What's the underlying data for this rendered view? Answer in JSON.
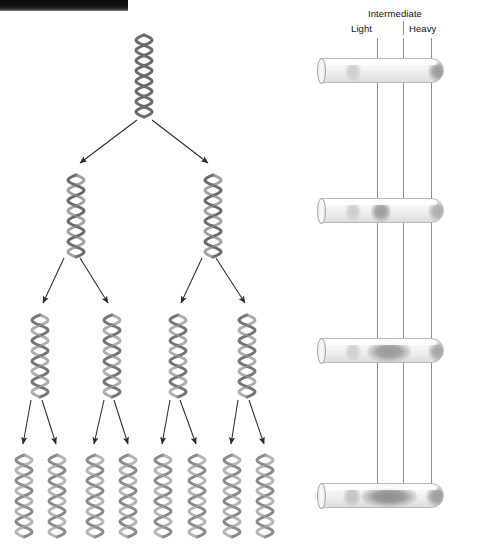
{
  "figure": {
    "artifact_bar": "black-scan-edge"
  },
  "gradient_panel": {
    "labels": {
      "intermediate": "Intermediate",
      "light": "Light",
      "heavy": "Heavy"
    },
    "guide_lines": [
      {
        "name": "light-guide",
        "x": 377
      },
      {
        "name": "intermediate-guide",
        "x": 403
      },
      {
        "name": "heavy-guide",
        "x": 431
      }
    ],
    "tubes": [
      {
        "name": "tube-generation-0",
        "x": 312,
        "y": 58,
        "bands": [
          {
            "position": "light",
            "x": 24,
            "width": 16,
            "intensity": "faint",
            "color": "#cdcdcd"
          },
          {
            "position": "heavy",
            "x": 107,
            "width": 22,
            "intensity": "strong",
            "color": "#9a9a9a"
          }
        ]
      },
      {
        "name": "tube-generation-1",
        "x": 312,
        "y": 198,
        "bands": [
          {
            "position": "light",
            "x": 24,
            "width": 16,
            "intensity": "faint",
            "color": "#cdcdcd"
          },
          {
            "position": "intermediate",
            "x": 50,
            "width": 20,
            "intensity": "strong",
            "color": "#9c9c9c"
          },
          {
            "position": "heavy",
            "x": 107,
            "width": 22,
            "intensity": "medium",
            "color": "#ababab"
          }
        ]
      },
      {
        "name": "tube-generation-2",
        "x": 312,
        "y": 338,
        "bands": [
          {
            "position": "light",
            "x": 24,
            "width": 16,
            "intensity": "faint",
            "color": "#d0d0d0"
          },
          {
            "position": "intermediate",
            "x": 46,
            "width": 44,
            "intensity": "strong",
            "color": "#989898"
          },
          {
            "position": "heavy",
            "x": 107,
            "width": 22,
            "intensity": "medium",
            "color": "#a5a5a5"
          }
        ]
      },
      {
        "name": "tube-generation-3",
        "x": 312,
        "y": 483,
        "bands": [
          {
            "position": "light",
            "x": 22,
            "width": 18,
            "intensity": "medium",
            "color": "#c2c2c2"
          },
          {
            "position": "intermediate",
            "x": 40,
            "width": 56,
            "intensity": "strong",
            "color": "#8f8f8f"
          },
          {
            "position": "heavy",
            "x": 105,
            "width": 24,
            "intensity": "strong",
            "color": "#9c9c9c"
          }
        ]
      }
    ]
  },
  "replication_tree": {
    "generations": [
      {
        "name": "generation-0",
        "count": 1,
        "y": 32,
        "helices": [
          {
            "name": "dna-helix-g0-1",
            "x": 131,
            "strand_a": "#6b6b6b",
            "strand_b": "#6b6b6b"
          }
        ]
      },
      {
        "name": "generation-1",
        "count": 2,
        "y": 172,
        "helices": [
          {
            "name": "dna-helix-g1-1",
            "x": 63,
            "strand_a": "#6b6b6b",
            "strand_b": "#a3a3a3"
          },
          {
            "name": "dna-helix-g1-2",
            "x": 200,
            "strand_a": "#6b6b6b",
            "strand_b": "#a3a3a3"
          }
        ]
      },
      {
        "name": "generation-2",
        "count": 4,
        "y": 312,
        "helices": [
          {
            "name": "dna-helix-g2-1",
            "x": 27,
            "strand_a": "#757575",
            "strand_b": "#aeaeae"
          },
          {
            "name": "dna-helix-g2-2",
            "x": 99,
            "strand_a": "#757575",
            "strand_b": "#aeaeae"
          },
          {
            "name": "dna-helix-g2-3",
            "x": 165,
            "strand_a": "#757575",
            "strand_b": "#aeaeae"
          },
          {
            "name": "dna-helix-g2-4",
            "x": 234,
            "strand_a": "#757575",
            "strand_b": "#aeaeae"
          }
        ]
      },
      {
        "name": "generation-3",
        "count": 8,
        "y": 452,
        "helices": [
          {
            "name": "dna-helix-g3-1",
            "x": 11,
            "strand_a": "#8a8a8a",
            "strand_b": "#b5b5b5"
          },
          {
            "name": "dna-helix-g3-2",
            "x": 44,
            "strand_a": "#8a8a8a",
            "strand_b": "#b5b5b5"
          },
          {
            "name": "dna-helix-g3-3",
            "x": 82,
            "strand_a": "#8a8a8a",
            "strand_b": "#b5b5b5"
          },
          {
            "name": "dna-helix-g3-4",
            "x": 115,
            "strand_a": "#8a8a8a",
            "strand_b": "#b5b5b5"
          },
          {
            "name": "dna-helix-g3-5",
            "x": 150,
            "strand_a": "#8a8a8a",
            "strand_b": "#b5b5b5"
          },
          {
            "name": "dna-helix-g3-6",
            "x": 184,
            "strand_a": "#8a8a8a",
            "strand_b": "#b5b5b5"
          },
          {
            "name": "dna-helix-g3-7",
            "x": 219,
            "strand_a": "#8a8a8a",
            "strand_b": "#b5b5b5"
          },
          {
            "name": "dna-helix-g3-8",
            "x": 252,
            "strand_a": "#8a8a8a",
            "strand_b": "#b5b5b5"
          }
        ]
      }
    ],
    "arrows": [
      {
        "name": "arrow-g0-to-g1-left",
        "x1": 137,
        "y1": 120,
        "x2": 80,
        "y2": 163
      },
      {
        "name": "arrow-g0-to-g1-right",
        "x1": 152,
        "y1": 120,
        "x2": 208,
        "y2": 163
      },
      {
        "name": "arrow-g1-to-g2-a",
        "x1": 64,
        "y1": 258,
        "x2": 43,
        "y2": 303
      },
      {
        "name": "arrow-g1-to-g2-b",
        "x1": 80,
        "y1": 258,
        "x2": 108,
        "y2": 303
      },
      {
        "name": "arrow-g1-to-g2-c",
        "x1": 202,
        "y1": 258,
        "x2": 181,
        "y2": 303
      },
      {
        "name": "arrow-g1-to-g2-d",
        "x1": 216,
        "y1": 258,
        "x2": 245,
        "y2": 303
      },
      {
        "name": "arrow-g2-to-g3-a",
        "x1": 31,
        "y1": 400,
        "x2": 23,
        "y2": 444
      },
      {
        "name": "arrow-g2-to-g3-b",
        "x1": 42,
        "y1": 400,
        "x2": 56,
        "y2": 444
      },
      {
        "name": "arrow-g2-to-g3-c",
        "x1": 104,
        "y1": 400,
        "x2": 94,
        "y2": 444
      },
      {
        "name": "arrow-g2-to-g3-d",
        "x1": 114,
        "y1": 400,
        "x2": 128,
        "y2": 444
      },
      {
        "name": "arrow-g2-to-g3-e",
        "x1": 170,
        "y1": 400,
        "x2": 162,
        "y2": 444
      },
      {
        "name": "arrow-g2-to-g3-f",
        "x1": 180,
        "y1": 400,
        "x2": 196,
        "y2": 444
      },
      {
        "name": "arrow-g2-to-g3-g",
        "x1": 238,
        "y1": 400,
        "x2": 231,
        "y2": 444
      },
      {
        "name": "arrow-g2-to-g3-h",
        "x1": 249,
        "y1": 400,
        "x2": 264,
        "y2": 444
      }
    ]
  }
}
